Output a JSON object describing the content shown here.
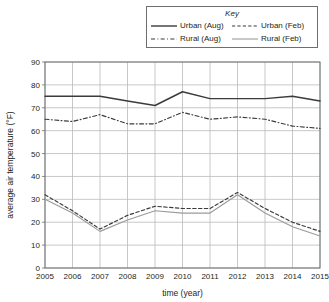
{
  "legend": {
    "title": "Key",
    "entries": [
      {
        "label": "Urban (Aug)",
        "style": "solid",
        "color": "#3b3b3d",
        "width": 1.4
      },
      {
        "label": "Urban (Feb)",
        "style": "dashed",
        "color": "#3b3b3d",
        "width": 1.2
      },
      {
        "label": "Rural (Aug)",
        "style": "dashdot",
        "color": "#3b3b3d",
        "width": 1.1
      },
      {
        "label": "Rural (Feb)",
        "style": "solid",
        "color": "#9b9b9e",
        "width": 1.1
      }
    ]
  },
  "chart_data": {
    "type": "line",
    "title": "",
    "xlabel": "time (year)",
    "ylabel": "average air temperature (°F)",
    "categories": [
      2005,
      2006,
      2007,
      2008,
      2009,
      2010,
      2011,
      2012,
      2013,
      2014,
      2015
    ],
    "xtick_labels": [
      "2005",
      "2006",
      "2007",
      "2008",
      "2009",
      "2010",
      "2011",
      "2012",
      "2013",
      "2014",
      "2015"
    ],
    "ytick_labels": [
      "0",
      "10",
      "20",
      "30",
      "40",
      "50",
      "60",
      "70",
      "80",
      "90"
    ],
    "xlim": [
      2005,
      2015
    ],
    "ylim": [
      0,
      90
    ],
    "ytick_step": 10,
    "grid": true,
    "legend_position": "above-right",
    "series": [
      {
        "name": "Urban (Aug)",
        "style": "solid",
        "color": "#3b3b3d",
        "values": [
          75,
          75,
          75,
          73,
          71,
          77,
          74,
          74,
          74,
          75,
          73
        ]
      },
      {
        "name": "Rural (Aug)",
        "style": "dashdot",
        "color": "#3b3b3d",
        "values": [
          65,
          64,
          67,
          63,
          63,
          68,
          65,
          66,
          65,
          62,
          61
        ]
      },
      {
        "name": "Urban (Feb)",
        "style": "dashed",
        "color": "#3b3b3d",
        "values": [
          32,
          25,
          17,
          23,
          27,
          26,
          26,
          33,
          26,
          20,
          16
        ]
      },
      {
        "name": "Rural (Feb)",
        "style": "solid",
        "color": "#9b9b9e",
        "values": [
          30,
          24,
          16,
          21,
          25,
          24,
          24,
          32,
          24,
          18,
          14
        ]
      }
    ]
  },
  "colors": {
    "grid": "#b9babc",
    "frame": "#6d6e71",
    "text": "#231f20",
    "background": "#ffffff"
  }
}
